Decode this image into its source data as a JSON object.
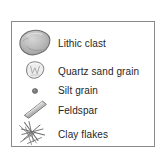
{
  "legend": {
    "title": "Sediment grain types legend",
    "border_color": "#8a8a8a",
    "background_color": "#ffffff",
    "text_color": "#262626",
    "items": [
      {
        "symbol": "lithic-clast-symbol",
        "label": "Lithic clast",
        "fill": "#b9b9b9",
        "stroke": "#6f6f6f",
        "shape": "rounded-irregular-pebble"
      },
      {
        "symbol": "quartz-sand-grain-symbol",
        "label": "Quartz sand grain",
        "fill": "#eaeaea",
        "stroke": "#7a7a7a",
        "shape": "small-rounded-grain-with-internal-facets"
      },
      {
        "symbol": "silt-grain-symbol",
        "label": "Silt grain",
        "fill": "#7d7d7d",
        "stroke": "#5c5c5c",
        "shape": "tiny-dot"
      },
      {
        "symbol": "feldspar-symbol",
        "label": "Feldspar",
        "fill": "#cfcfcf",
        "stroke": "#767676",
        "shape": "elongate-diagonal-lath"
      },
      {
        "symbol": "clay-flakes-symbol",
        "label": "Clay flakes",
        "fill": "none",
        "stroke": "#6b6b6b",
        "shape": "crossed-thin-slivers"
      }
    ]
  }
}
